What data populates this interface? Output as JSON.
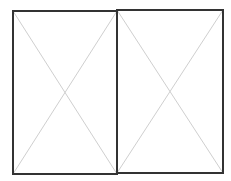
{
  "diagram": {
    "type": "image-placeholder-pair",
    "panels": [
      {
        "id": "left",
        "x1": 13,
        "y1": 11,
        "x2": 117,
        "y2": 174
      },
      {
        "id": "right",
        "x1": 117,
        "y1": 10,
        "x2": 223,
        "y2": 173
      }
    ],
    "colors": {
      "border": "#333333",
      "diagonal": "#cfcfcf",
      "background": "#ffffff"
    }
  }
}
